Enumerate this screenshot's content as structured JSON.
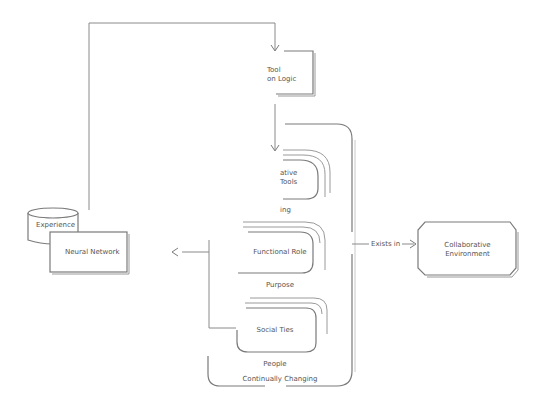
{
  "diagram": {
    "nodes": {
      "tool": {
        "line1": "Tool",
        "line2": "on Logic"
      },
      "creative_tools": {
        "line1": "ative",
        "line2": "Tools",
        "caption": "ing"
      },
      "functional_role": {
        "label": "Functional Role",
        "caption": "Purpose"
      },
      "social_ties": {
        "label": "Social Ties",
        "caption": "People"
      },
      "container": {
        "caption": "Continually Changing"
      },
      "experience": {
        "label": "Experience"
      },
      "neural_network": {
        "label": "Neural Network"
      },
      "environment": {
        "line1": "Collaborative",
        "line2": "Environment"
      }
    },
    "edges": {
      "exists_in": {
        "label": "Exists in"
      },
      "to_neural_arrow": {
        "glyph": "<"
      },
      "to_environment_arrow": {
        "glyph": ">"
      }
    },
    "colors": {
      "stroke": "#7a7a7a",
      "text": "#555555",
      "background": "#ffffff"
    }
  }
}
